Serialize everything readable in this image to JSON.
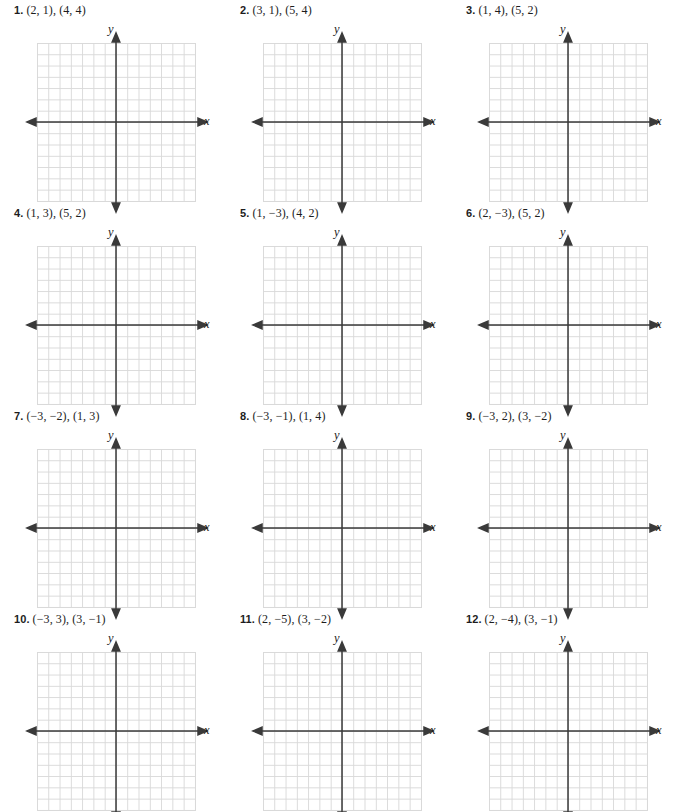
{
  "page": {
    "axis_labels": {
      "x": "x",
      "y": "y"
    },
    "grid": {
      "columns": 14,
      "rows": 14,
      "x_min": -7,
      "x_max": 7,
      "y_min": -7,
      "y_max": 7,
      "grid_line_color": "#d9d9d9",
      "axis_color": "#3a3a3a"
    }
  },
  "exercises": [
    {
      "number": "1.",
      "points": "(2, 1), (4, 4)"
    },
    {
      "number": "2.",
      "points": "(3, 1), (5, 4)"
    },
    {
      "number": "3.",
      "points": "(1, 4), (5, 2)"
    },
    {
      "number": "4.",
      "points": "(1, 3), (5, 2)"
    },
    {
      "number": "5.",
      "points": "(1, −3), (4, 2)"
    },
    {
      "number": "6.",
      "points": "(2, −3), (5, 2)"
    },
    {
      "number": "7.",
      "points": "(−3, −2), (1, 3)"
    },
    {
      "number": "8.",
      "points": "(−3, −1), (1, 4)"
    },
    {
      "number": "9.",
      "points": "(−3, 2), (3, −2)"
    },
    {
      "number": "10.",
      "points": "(−3, 3), (3, −1)"
    },
    {
      "number": "11.",
      "points": "(2, −5), (3, −2)"
    },
    {
      "number": "12.",
      "points": "(2, −4), (3, −1)"
    }
  ]
}
